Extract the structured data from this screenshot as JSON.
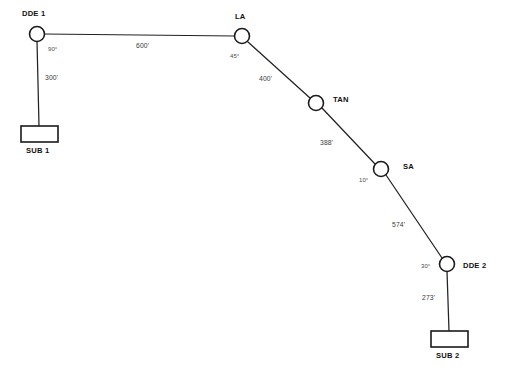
{
  "diagram": {
    "type": "network-layout-diagram",
    "units": "feet",
    "angle_unit": "degrees",
    "background_color": "#ffffff",
    "line_color": "#222222",
    "node_fill_color": "#ffffff"
  },
  "nodes": [
    {
      "id": "dde1",
      "label": "DDE 1",
      "shape": "circle",
      "cx": 37,
      "cy": 34,
      "r": 7.5,
      "label_x": 22,
      "label_y": 10,
      "angle": "90°",
      "angle_x": 48,
      "angle_y": 46
    },
    {
      "id": "la",
      "label": "LA",
      "shape": "circle",
      "cx": 242,
      "cy": 36,
      "r": 7.5,
      "label_x": 235,
      "label_y": 13,
      "angle": "45°",
      "angle_x": 230,
      "angle_y": 53
    },
    {
      "id": "tan",
      "label": "TAN",
      "shape": "circle",
      "cx": 316,
      "cy": 103,
      "r": 7.5,
      "label_x": 333,
      "label_y": 96,
      "angle": null,
      "angle_x": null,
      "angle_y": null
    },
    {
      "id": "sa",
      "label": "SA",
      "shape": "circle",
      "cx": 381,
      "cy": 169,
      "r": 7.5,
      "label_x": 403,
      "label_y": 163,
      "angle": "10°",
      "angle_x": 359,
      "angle_y": 177
    },
    {
      "id": "dde2",
      "label": "DDE 2",
      "shape": "circle",
      "cx": 447,
      "cy": 264,
      "r": 7.5,
      "label_x": 463,
      "label_y": 262,
      "angle": "30°",
      "angle_x": 421,
      "angle_y": 263
    }
  ],
  "substations": [
    {
      "id": "sub1",
      "label": "SUB 1",
      "shape": "rect",
      "x": 21,
      "y": 126,
      "w": 37,
      "h": 16,
      "label_x": 26,
      "label_y": 147
    },
    {
      "id": "sub2",
      "label": "SUB 2",
      "shape": "rect",
      "x": 431,
      "y": 331,
      "w": 37,
      "h": 16,
      "label_x": 436,
      "label_y": 352
    }
  ],
  "edges": [
    {
      "id": "dde1-la",
      "from": "DDE 1",
      "to": "LA",
      "x1": 44,
      "y1": 34,
      "x2": 235,
      "y2": 36,
      "distance": "600'",
      "label_x": 136,
      "label_y": 43
    },
    {
      "id": "dde1-sub1",
      "from": "DDE 1",
      "to": "SUB 1",
      "x1": 37,
      "y1": 41,
      "x2": 39,
      "y2": 126,
      "distance": "300'",
      "label_x": 45,
      "label_y": 75
    },
    {
      "id": "la-tan",
      "from": "LA",
      "to": "TAN",
      "x1": 248,
      "y1": 42,
      "x2": 310,
      "y2": 98,
      "distance": "400'",
      "label_x": 259,
      "label_y": 76
    },
    {
      "id": "tan-sa",
      "from": "TAN",
      "to": "SA",
      "x1": 322,
      "y1": 108,
      "x2": 375,
      "y2": 164,
      "distance": "388'",
      "label_x": 320,
      "label_y": 140
    },
    {
      "id": "sa-dde2",
      "from": "SA",
      "to": "DDE 2",
      "x1": 386,
      "y1": 175,
      "x2": 442,
      "y2": 258,
      "distance": "574'",
      "label_x": 392,
      "label_y": 222
    },
    {
      "id": "dde2-sub2",
      "from": "DDE 2",
      "to": "SUB 2",
      "x1": 447,
      "y1": 271,
      "x2": 449,
      "y2": 331,
      "distance": "273'",
      "label_x": 422,
      "label_y": 295
    }
  ]
}
